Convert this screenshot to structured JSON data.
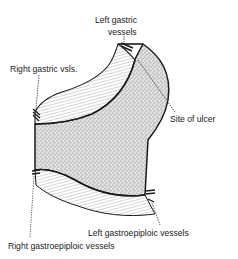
{
  "diagram": {
    "type": "anatomical-illustration",
    "labels": {
      "left_gastric_line1": "Left gastric",
      "left_gastric_line2": "vessels",
      "right_gastric": "Right gastric vsls.",
      "site_of_ulcer": "Site of ulcer",
      "left_gastroepiploic": "Left gastroepiploic vessels",
      "right_gastroepiploic": "Right gastroepiploic vessels"
    },
    "colors": {
      "ink": "#1a1a1a",
      "stipple": "#8a8a8a",
      "background": "#ffffff"
    }
  }
}
